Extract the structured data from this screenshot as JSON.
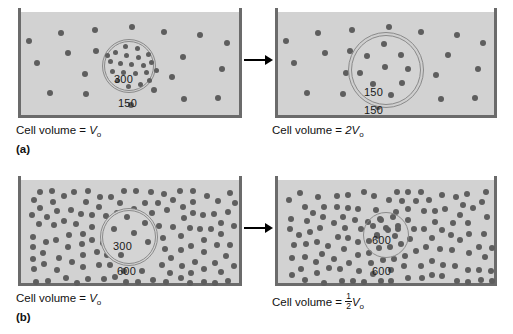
{
  "figure": {
    "colors": {
      "solution_fill": "#d2d2d2",
      "beaker_wall": "#6b6b6b",
      "particle": "#5e5e5e",
      "cell_membrane": "#8a8a8a",
      "text": "#111111"
    }
  },
  "panels": [
    {
      "letter": "(a)",
      "left": {
        "outside_label": "150",
        "inside_label": "300",
        "caption_prefix": "Cell volume = ",
        "caption_value": "V",
        "caption_sub": "o",
        "caption_fraction": null,
        "cell_state": "normal",
        "outside_density": "low",
        "inside_particles": 21,
        "outside_particles": 20
      },
      "right": {
        "outside_label": "150",
        "inside_label": "150",
        "caption_prefix": "Cell volume = ",
        "caption_value": "2V",
        "caption_sub": "o",
        "caption_fraction": null,
        "cell_state": "swollen",
        "outside_density": "low",
        "inside_particles": 9,
        "outside_particles": 20
      },
      "arrow": "right-arrow"
    },
    {
      "letter": "(b)",
      "left": {
        "outside_label": "600",
        "inside_label": "300",
        "caption_prefix": "Cell volume = ",
        "caption_value": "V",
        "caption_sub": "o",
        "caption_fraction": null,
        "cell_state": "normal",
        "outside_density": "high",
        "inside_particles": 6,
        "outside_particles": 150
      },
      "right": {
        "outside_label": "600",
        "inside_label": "600",
        "caption_prefix": "Cell volume = ",
        "caption_value": "V",
        "caption_sub": "o",
        "caption_fraction": {
          "num": "1",
          "den": "2"
        },
        "cell_state": "shrunken",
        "outside_density": "high",
        "inside_particles": 7,
        "outside_particles": 160
      },
      "arrow": "right-arrow"
    }
  ]
}
